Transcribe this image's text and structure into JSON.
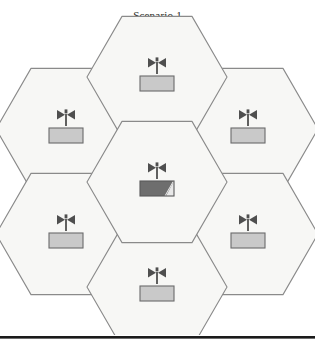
{
  "figure": {
    "caption": "Scenario 1",
    "type": "hexagonal-cell-layout",
    "colors": {
      "cell_fill": "#f7f7f5",
      "cell_stroke": "#8a8a8a",
      "page_background": "#ffffff",
      "antenna_stroke": "#555555",
      "base_station_fill": "#c9c9c9",
      "base_station_stroke": "#6b6b6b",
      "serving_base_station_fill": "#6e6e6e",
      "serving_base_station_highlight": "#e8e8e8",
      "caption_text": "#231f20",
      "footer_rule": "#1b1b1b"
    },
    "geometry": {
      "orientation": "flat-top",
      "cell_radius": 70,
      "center_x": 157,
      "center_y": 182,
      "cell_count": 7
    },
    "cells": [
      {
        "id": "cell-center",
        "position": "center",
        "cx": 157,
        "cy": 182,
        "serving": true,
        "icon": "antenna-icon",
        "base_label": "base-station"
      },
      {
        "id": "cell-top",
        "position": "top",
        "cx": 157,
        "cy": 77,
        "serving": false,
        "icon": "antenna-icon",
        "base_label": "base-station"
      },
      {
        "id": "cell-upper-left",
        "position": "upper-left",
        "cx": 66,
        "cy": 129,
        "serving": false,
        "icon": "antenna-icon",
        "base_label": "base-station"
      },
      {
        "id": "cell-upper-right",
        "position": "upper-right",
        "cx": 248,
        "cy": 129,
        "serving": false,
        "icon": "antenna-icon",
        "base_label": "base-station"
      },
      {
        "id": "cell-lower-left",
        "position": "lower-left",
        "cx": 66,
        "cy": 234,
        "serving": false,
        "icon": "antenna-icon",
        "base_label": "base-station"
      },
      {
        "id": "cell-lower-right",
        "position": "lower-right",
        "cx": 248,
        "cy": 234,
        "serving": false,
        "icon": "antenna-icon",
        "base_label": "base-station"
      },
      {
        "id": "cell-bottom",
        "position": "bottom",
        "cx": 157,
        "cy": 287,
        "serving": false,
        "icon": "antenna-icon",
        "base_label": "base-station"
      }
    ]
  }
}
